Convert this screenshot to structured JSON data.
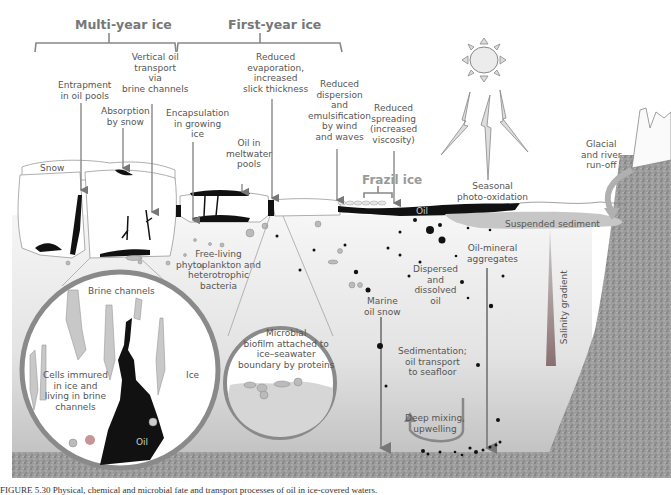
{
  "headers": {
    "multi_year": "Multi-year ice",
    "first_year": "First-year ice",
    "frazil": "Frazil ice"
  },
  "labels": {
    "entrapment": [
      "Entrapment",
      "in oil pools"
    ],
    "vertical": [
      "Vertical oil",
      "transport",
      "via",
      "brine channels"
    ],
    "absorption": [
      "Absorption",
      "by snow"
    ],
    "encapsulation": [
      "Encapsulation",
      "in growing",
      "ice"
    ],
    "meltwater": [
      "Oil in",
      "meltwater",
      "pools"
    ],
    "evaporation": [
      "Reduced",
      "evaporation,",
      "increased",
      "slick thickness"
    ],
    "dispersion": [
      "Reduced",
      "dispersion",
      "and",
      "emulsification",
      "by wind",
      "and waves"
    ],
    "spreading": [
      "Reduced",
      "spreading",
      "(increased",
      "viscosity)"
    ],
    "photo": [
      "Seasonal",
      "photo-oxidation"
    ],
    "glacial": [
      "Glacial",
      "and river",
      "run-off"
    ],
    "snow": "Snow",
    "oil_surface": "Oil",
    "suspended": "Suspended sediment",
    "freeliving": [
      "Free-living",
      "phytoplankton and",
      "heterotrophic",
      "bacteria"
    ],
    "oilmineral": [
      "Oil-mineral",
      "aggregates"
    ],
    "dispersed": [
      "Dispersed",
      "and",
      "dissolved",
      "oil"
    ],
    "marine_snow": [
      "Marine",
      "oil snow"
    ],
    "salinity": "Salinity gradient",
    "sedimentation": [
      "Sedimentation;",
      "oil transport",
      "to seafloor"
    ],
    "deep_mixing": [
      "Deep mixing,",
      "upwelling"
    ],
    "brine_channels": "Brine channels",
    "cells": [
      "Cells immured",
      "in ice and",
      "living in brine",
      "channels"
    ],
    "ice": "Ice",
    "oil_inset": "Oil",
    "biofilm": [
      "Microbial",
      "biofilm attached to",
      "ice–seawater",
      "boundary by proteins"
    ]
  },
  "caption": "FIGURE 5.30   Physical, chemical and microbial fate and transport processes of oil in ice-covered waters.",
  "colors": {
    "text": "#555555",
    "header": "#777777",
    "oil": "#111111",
    "water_top": "#f2f2f2",
    "water_bottom": "#c9c9c9",
    "seafloor": "#9a9a9a",
    "ring": "#7a7a7a",
    "arrow": "#777777"
  }
}
